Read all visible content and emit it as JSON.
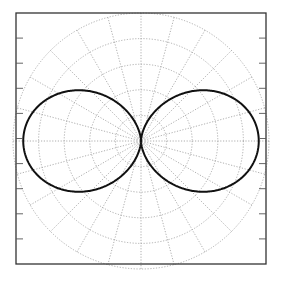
{
  "chart_data": {
    "type": "line",
    "subtype": "polar",
    "title": "",
    "xlabel": "",
    "ylabel": "",
    "series": [
      {
        "name": "pattern",
        "formula": "r = |cos(theta)|^1.5",
        "exponent": 1.5,
        "r_max": 0.92,
        "color": "#111111"
      }
    ],
    "radial_grid": [
      0.2,
      0.4,
      0.6,
      0.8,
      1.0
    ],
    "angular_grid_step_deg": 15,
    "grid": true,
    "grid_style": "dotted",
    "grid_color": "#9a9a9a",
    "ylim": [
      -1,
      1
    ],
    "xlim": [
      -1,
      1
    ],
    "y_ticks_count": 9,
    "tick_labels_visible": false,
    "legend": null
  },
  "frame": {
    "left": 16,
    "top": 13,
    "right": 266,
    "bottom": 264,
    "color": "#333333"
  },
  "center": {
    "x": 141,
    "y": 141
  },
  "outer_radius_px": 128
}
